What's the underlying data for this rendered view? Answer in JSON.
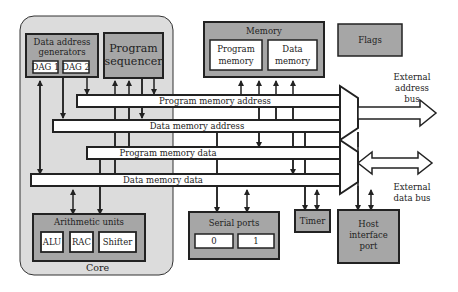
{
  "colors": {
    "core_bg": "#dcdcdc",
    "unit_bg": "#a6a6a6",
    "inner_box_bg": "#ffffff",
    "bus_fill": "#ffffff",
    "stroke": "#222222"
  },
  "core": {
    "label": "Core",
    "data_address_generators": {
      "title_line1": "Data address",
      "title_line2": "generators",
      "dag1": "DAG 1",
      "dag2": "DAG 2"
    },
    "program_sequencer": {
      "line1": "Program",
      "line2": "sequencer"
    },
    "arithmetic_units": {
      "title": "Arithmetic units",
      "alu": "ALU",
      "rac": "RAC",
      "shifter": "Shifter"
    }
  },
  "memory": {
    "title": "Memory",
    "program_memory_line1": "Program",
    "program_memory_line2": "memory",
    "data_memory_line1": "Data",
    "data_memory_line2": "memory"
  },
  "flags": {
    "label": "Flags"
  },
  "buses": {
    "program_memory_address": "Program memory address",
    "data_memory_address": "Data memory address",
    "program_memory_data": "Program memory data",
    "data_memory_data": "Data memory data"
  },
  "external": {
    "address_bus_line1": "External",
    "address_bus_line2": "address",
    "address_bus_line3": "bus",
    "data_bus_line1": "External",
    "data_bus_line2": "data bus"
  },
  "peripherals": {
    "serial_ports": {
      "title": "Serial ports",
      "port0": "0",
      "port1": "1"
    },
    "timer": {
      "label": "Timer"
    },
    "host_interface_port": {
      "line1": "Host",
      "line2": "interface",
      "line3": "port"
    }
  }
}
